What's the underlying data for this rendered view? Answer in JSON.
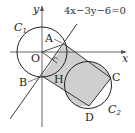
{
  "diagram": {
    "equation": "4x−3y−6=0",
    "axes": {
      "x_label": "x",
      "y_label": "y"
    },
    "points": {
      "A": "A",
      "B": "B",
      "C": "C",
      "D": "D",
      "O": "O",
      "H": "H"
    },
    "circles": {
      "c1": {
        "label": "C",
        "sub": "1"
      },
      "c2": {
        "label": "C",
        "sub": "2"
      }
    },
    "colors": {
      "stroke": "#222222",
      "shade": "#cfcfcf"
    }
  }
}
